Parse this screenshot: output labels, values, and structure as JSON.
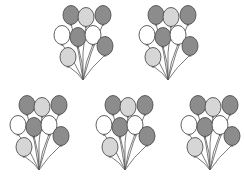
{
  "colors": {
    "dark": "#8c8c8c",
    "light": "#d6d6d6",
    "white": "#ffffff",
    "outline": "#4f4f4f",
    "string": "#5a5a5a"
  },
  "bunches": [
    {
      "id": 1,
      "x": 50,
      "y": 0,
      "balloon_count": 8
    },
    {
      "id": 2,
      "x": 135,
      "y": 0,
      "balloon_count": 8
    },
    {
      "id": 3,
      "x": 6,
      "y": 90,
      "balloon_count": 8
    },
    {
      "id": 4,
      "x": 92,
      "y": 90,
      "balloon_count": 8
    },
    {
      "id": 5,
      "x": 177,
      "y": 90,
      "balloon_count": 8
    }
  ],
  "balloon_pattern": [
    {
      "cx": 21,
      "cy": 15,
      "shade": "dark"
    },
    {
      "cx": 36,
      "cy": 17,
      "shade": "light"
    },
    {
      "cx": 53,
      "cy": 15,
      "shade": "dark"
    },
    {
      "cx": 12,
      "cy": 35,
      "shade": "white"
    },
    {
      "cx": 28,
      "cy": 37,
      "shade": "dark"
    },
    {
      "cx": 43,
      "cy": 35,
      "shade": "white"
    },
    {
      "cx": 55,
      "cy": 46,
      "shade": "dark"
    },
    {
      "cx": 18,
      "cy": 57,
      "shade": "light"
    }
  ],
  "knot": {
    "x": 33,
    "y": 80
  }
}
